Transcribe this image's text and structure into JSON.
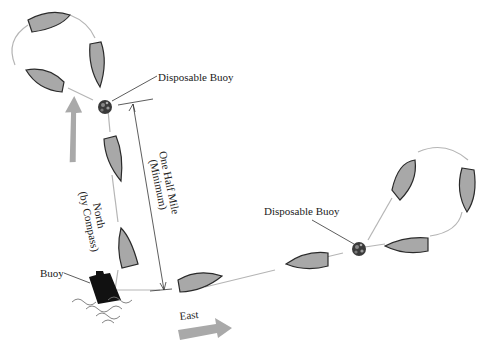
{
  "diagram": {
    "labels": {
      "disposable_buoy_top": "Disposable Buoy",
      "disposable_buoy_right": "Disposable Buoy",
      "buoy": "Buoy",
      "distance_line1": "One Half Mile",
      "distance_line2": "(Minimum)",
      "north_line1": "North",
      "north_line2": "(by Compass)",
      "east": "East"
    },
    "colors": {
      "boat_fill": "#a8a8a8",
      "boat_stroke": "#2a2a2a",
      "track": "#b5b5b5",
      "arrow_fill": "#a9a9a9",
      "buoy_fill": "#1a1a1a",
      "background": "#ffffff"
    }
  }
}
